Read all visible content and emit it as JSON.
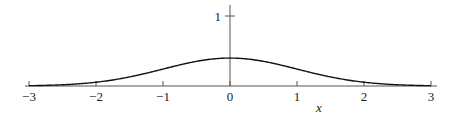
{
  "chart_data": {
    "type": "line",
    "title": "",
    "xlabel": "x",
    "ylabel": "",
    "xlim": [
      -3,
      3
    ],
    "ylim": [
      0,
      1.1
    ],
    "grid": false,
    "legend": null,
    "x_ticks": [
      "-3",
      "-2",
      "-1",
      "0",
      "1",
      "2",
      "3"
    ],
    "y_ticks": [
      "1"
    ],
    "series": [
      {
        "name": "standard normal density",
        "x": [
          -3,
          -2.5,
          -2,
          -1.5,
          -1,
          -0.5,
          0,
          0.5,
          1,
          1.5,
          2,
          2.5,
          3
        ],
        "values": [
          0.004,
          0.018,
          0.054,
          0.13,
          0.242,
          0.352,
          0.399,
          0.352,
          0.242,
          0.13,
          0.054,
          0.018,
          0.004
        ]
      }
    ]
  },
  "colors": {
    "curve": "#111111",
    "axis": "#555555"
  }
}
